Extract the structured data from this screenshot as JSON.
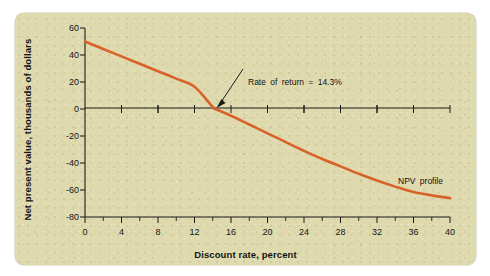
{
  "figure": {
    "background_color": "#dedaae",
    "page_background": "#ffffff"
  },
  "chart_data": {
    "type": "line",
    "title": "",
    "xlabel": "Discount rate, percent",
    "ylabel": "Net present value, thousands of dollars",
    "xlim": [
      0,
      40
    ],
    "ylim": [
      -80,
      60
    ],
    "xticks": [
      0,
      4,
      8,
      12,
      16,
      20,
      24,
      28,
      32,
      36,
      40
    ],
    "xticklabels": [
      "0",
      "4",
      "8",
      "12",
      "16",
      "20",
      "24",
      "28",
      "32",
      "36",
      "40"
    ],
    "xminor_step": 2,
    "yticks": [
      60,
      40,
      20,
      0,
      -20,
      -40,
      -60,
      -80
    ],
    "yticklabels": [
      "60",
      "40",
      "20",
      "0",
      "-20",
      "-40",
      "-60",
      "-80"
    ],
    "grid": false,
    "legend": "none",
    "series": [
      {
        "name": "NPV profile",
        "color": "#d9622b",
        "x": [
          0,
          2,
          4,
          6,
          8,
          10,
          12,
          14,
          14.3,
          16,
          18,
          20,
          22,
          24,
          26,
          28,
          30,
          32,
          34,
          36,
          38,
          40
        ],
        "y": [
          50,
          44.5,
          39,
          33.5,
          28,
          22.5,
          16.5,
          1.5,
          0,
          -5,
          -11.5,
          -18,
          -24.5,
          -31,
          -37,
          -42.5,
          -48,
          -53,
          -57.5,
          -61.5,
          -64,
          -66
        ]
      }
    ],
    "annotations": [
      {
        "name": "rate-of-return",
        "text": "Rate of return  =  14.3%",
        "point_x": 14.3,
        "point_y": 0
      },
      {
        "name": "npv-profile-label",
        "text": "NPV  profile",
        "point_x": 31,
        "point_y": -45
      }
    ]
  }
}
